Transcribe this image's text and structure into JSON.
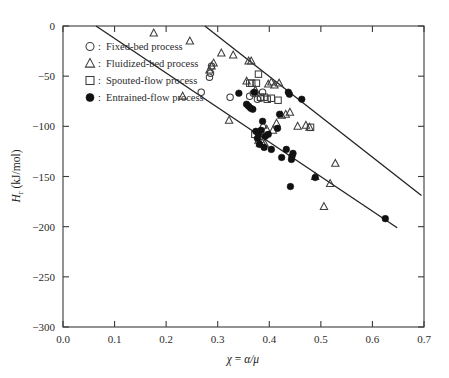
{
  "chart_data": {
    "type": "scatter",
    "title": "",
    "xlabel": "χ = α/μ",
    "ylabel": "Hᵣ (kJ/mol)",
    "ylabel_parts": {
      "main": "H",
      "sub": "r",
      "unit": " (kJ/mol)"
    },
    "xlim": [
      0.0,
      0.7
    ],
    "ylim": [
      -300,
      0
    ],
    "y_axis_inverted": true,
    "grid": false,
    "xticks": [
      0.0,
      0.1,
      0.2,
      0.3,
      0.4,
      0.5,
      0.6,
      0.7
    ],
    "xtick_labels": [
      "0.0",
      "0.1",
      "0.2",
      "0.3",
      "0.4",
      "0.5",
      "0.6",
      "0.7"
    ],
    "yticks": [
      0,
      -50,
      -100,
      -150,
      -200,
      -250,
      -300
    ],
    "ytick_labels": [
      "0",
      "−50",
      "−100",
      "−150",
      "−200",
      "−250",
      "−300"
    ],
    "legend_position": "upper-left",
    "series": [
      {
        "name": "Fixed-bed process",
        "marker": "open-circle",
        "color": "#3c3c3c",
        "points": [
          {
            "x": 0.268,
            "y": -66
          },
          {
            "x": 0.284,
            "y": -51
          },
          {
            "x": 0.286,
            "y": -47
          },
          {
            "x": 0.288,
            "y": -40
          },
          {
            "x": 0.324,
            "y": -71
          },
          {
            "x": 0.362,
            "y": -70
          },
          {
            "x": 0.369,
            "y": -67
          },
          {
            "x": 0.377,
            "y": -73
          },
          {
            "x": 0.383,
            "y": -72
          },
          {
            "x": 0.387,
            "y": -66
          }
        ]
      },
      {
        "name": "Fluidized-bed process",
        "marker": "open-triangle",
        "color": "#3c3c3c",
        "points": [
          {
            "x": 0.176,
            "y": -7
          },
          {
            "x": 0.232,
            "y": -70
          },
          {
            "x": 0.246,
            "y": -15
          },
          {
            "x": 0.284,
            "y": -44
          },
          {
            "x": 0.288,
            "y": -40
          },
          {
            "x": 0.292,
            "y": -37
          },
          {
            "x": 0.307,
            "y": -27
          },
          {
            "x": 0.322,
            "y": -94
          },
          {
            "x": 0.33,
            "y": -29
          },
          {
            "x": 0.356,
            "y": -55
          },
          {
            "x": 0.36,
            "y": -35
          },
          {
            "x": 0.365,
            "y": -35
          },
          {
            "x": 0.373,
            "y": -64
          },
          {
            "x": 0.379,
            "y": -114
          },
          {
            "x": 0.382,
            "y": -117
          },
          {
            "x": 0.386,
            "y": -116
          },
          {
            "x": 0.388,
            "y": -99
          },
          {
            "x": 0.391,
            "y": -117
          },
          {
            "x": 0.395,
            "y": -103
          },
          {
            "x": 0.398,
            "y": -58
          },
          {
            "x": 0.404,
            "y": -56
          },
          {
            "x": 0.407,
            "y": -104
          },
          {
            "x": 0.41,
            "y": -59
          },
          {
            "x": 0.414,
            "y": -97
          },
          {
            "x": 0.419,
            "y": -57
          },
          {
            "x": 0.424,
            "y": -89
          },
          {
            "x": 0.432,
            "y": -88
          },
          {
            "x": 0.44,
            "y": -86
          },
          {
            "x": 0.455,
            "y": -100
          },
          {
            "x": 0.471,
            "y": -99
          },
          {
            "x": 0.478,
            "y": -101
          },
          {
            "x": 0.489,
            "y": -150
          },
          {
            "x": 0.506,
            "y": -180
          },
          {
            "x": 0.518,
            "y": -157
          },
          {
            "x": 0.528,
            "y": -137
          }
        ]
      },
      {
        "name": "Spouted-flow process",
        "marker": "open-square",
        "color": "#3c3c3c",
        "points": [
          {
            "x": 0.362,
            "y": -57
          },
          {
            "x": 0.366,
            "y": -57
          },
          {
            "x": 0.372,
            "y": -108
          },
          {
            "x": 0.375,
            "y": -57
          },
          {
            "x": 0.379,
            "y": -48
          },
          {
            "x": 0.383,
            "y": -71
          },
          {
            "x": 0.39,
            "y": -71
          },
          {
            "x": 0.396,
            "y": -73
          },
          {
            "x": 0.404,
            "y": -72
          },
          {
            "x": 0.417,
            "y": -74
          },
          {
            "x": 0.48,
            "y": -101
          }
        ]
      },
      {
        "name": "Entrained-flow process",
        "marker": "filled-circle",
        "color": "#111111",
        "points": [
          {
            "x": 0.341,
            "y": -67
          },
          {
            "x": 0.356,
            "y": -78
          },
          {
            "x": 0.36,
            "y": -80
          },
          {
            "x": 0.364,
            "y": -82
          },
          {
            "x": 0.368,
            "y": -83
          },
          {
            "x": 0.371,
            "y": -66
          },
          {
            "x": 0.374,
            "y": -105
          },
          {
            "x": 0.377,
            "y": -112
          },
          {
            "x": 0.379,
            "y": -108
          },
          {
            "x": 0.381,
            "y": -118
          },
          {
            "x": 0.384,
            "y": -104
          },
          {
            "x": 0.387,
            "y": -95
          },
          {
            "x": 0.39,
            "y": -121
          },
          {
            "x": 0.392,
            "y": -110
          },
          {
            "x": 0.398,
            "y": -108
          },
          {
            "x": 0.404,
            "y": -123
          },
          {
            "x": 0.416,
            "y": -102
          },
          {
            "x": 0.42,
            "y": -88
          },
          {
            "x": 0.424,
            "y": -131
          },
          {
            "x": 0.433,
            "y": -123
          },
          {
            "x": 0.437,
            "y": -66
          },
          {
            "x": 0.439,
            "y": -68
          },
          {
            "x": 0.441,
            "y": -160
          },
          {
            "x": 0.443,
            "y": -133
          },
          {
            "x": 0.444,
            "y": -130
          },
          {
            "x": 0.446,
            "y": -127
          },
          {
            "x": 0.463,
            "y": -73
          },
          {
            "x": 0.489,
            "y": -151
          },
          {
            "x": 0.625,
            "y": -192
          }
        ]
      }
    ],
    "trend_lines": [
      {
        "name": "upper-bound-line",
        "x1": 0.064,
        "y1": 0,
        "x2": 0.648,
        "y2": -201
      },
      {
        "name": "lower-bound-line",
        "x1": 0.275,
        "y1": 0,
        "x2": 0.695,
        "y2": -169
      }
    ]
  },
  "legend": {
    "items": [
      {
        "symbol": "open-circle",
        "separator": ":",
        "label": "Fixed-bed process"
      },
      {
        "symbol": "open-triangle",
        "separator": ":",
        "label": "Fluidized-bed process"
      },
      {
        "symbol": "open-square",
        "separator": ":",
        "label": "Spouted-flow process"
      },
      {
        "symbol": "filled-circle",
        "separator": ":",
        "label": "Entrained-flow process"
      }
    ]
  }
}
